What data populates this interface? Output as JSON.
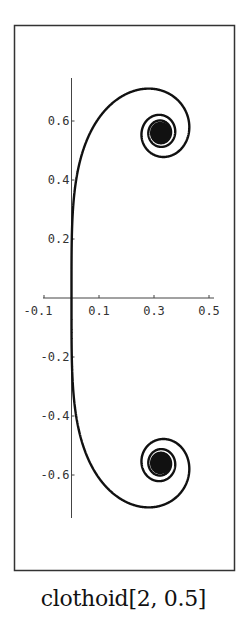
{
  "chart_data": {
    "type": "line",
    "title": "clothoid[2, 0.5]",
    "xlabel": "",
    "ylabel": "",
    "xlim": [
      -0.1,
      0.5
    ],
    "ylim": [
      -0.75,
      0.75
    ],
    "x_ticks": [
      "-0.1",
      "0.1",
      "0.3",
      "0.5"
    ],
    "y_ticks": [
      "0.6",
      "0.4",
      "0.2",
      "-0.2",
      "-0.4",
      "-0.6"
    ],
    "grid": false,
    "legend": null,
    "series": [
      {
        "name": "clothoid",
        "description": "Generalized Euler spiral symmetric about the x-axis; straight vertical through origin, spiralling into limit points",
        "limit_points": [
          [
            0.33,
            0.56
          ],
          [
            0.33,
            -0.56
          ]
        ],
        "sample_points": [
          [
            0.0,
            0.0
          ],
          [
            0.0,
            0.3
          ],
          [
            0.05,
            0.5
          ],
          [
            0.15,
            0.67
          ],
          [
            0.29,
            0.71
          ],
          [
            0.44,
            0.6
          ],
          [
            0.4,
            0.5
          ],
          [
            0.3,
            0.52
          ],
          [
            0.33,
            0.56
          ],
          [
            0.0,
            -0.3
          ],
          [
            0.15,
            -0.67
          ],
          [
            0.29,
            -0.71
          ],
          [
            0.44,
            -0.6
          ],
          [
            0.33,
            -0.56
          ]
        ]
      }
    ]
  },
  "caption": "clothoid[2, 0.5]",
  "colors": {
    "curve": "#111111",
    "axes": "#444444",
    "frame": "#333333"
  }
}
